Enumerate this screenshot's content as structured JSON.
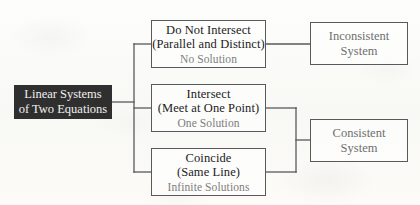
{
  "diagram": {
    "type": "flowchart",
    "root": {
      "label_line1": "Linear Systems",
      "label_line2": "of Two Equations",
      "fill_color": "#2f2f2f",
      "text_color": "#f2f0ec"
    },
    "branches": [
      {
        "name": "no-intersect",
        "title": "Do Not Intersect",
        "subtitle": "(Parallel and Distinct)",
        "solution": "No Solution",
        "solution_color": "#7d7d7d"
      },
      {
        "name": "intersect",
        "title": "Intersect",
        "subtitle": "(Meet at One Point)",
        "solution": "One Solution",
        "solution_color": "#7d7d7d"
      },
      {
        "name": "coincide",
        "title": "Coincide",
        "subtitle": "(Same Line)",
        "solution": "Infinite Solutions",
        "solution_color": "#7d7d7d"
      }
    ],
    "results": [
      {
        "name": "inconsistent",
        "line1": "Inconsistent",
        "line2": "System",
        "text_color": "#6f6f6f",
        "from": [
          "no-intersect"
        ]
      },
      {
        "name": "consistent",
        "line1": "Consistent",
        "line2": "System",
        "text_color": "#6f6f6f",
        "from": [
          "intersect",
          "coincide"
        ]
      }
    ],
    "line_color": "#58595b",
    "background_color": "#fbfbf9"
  }
}
